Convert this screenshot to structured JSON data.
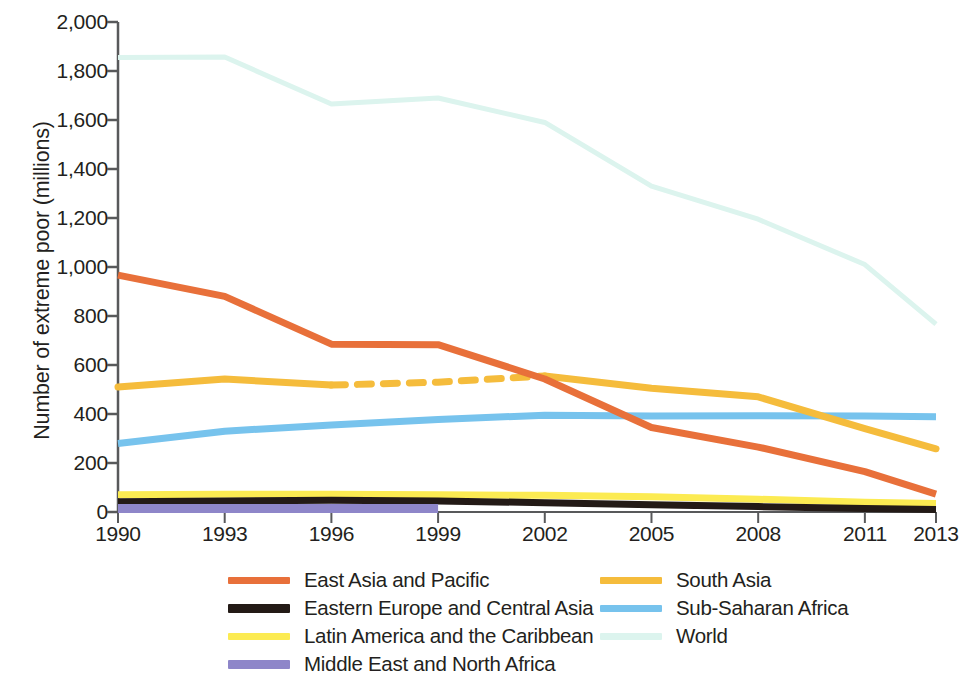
{
  "chart_data": {
    "type": "line",
    "title": "",
    "xlabel": "",
    "ylabel": "Number of extreme poor (millions)",
    "x": [
      1990,
      1993,
      1996,
      1999,
      2002,
      2005,
      2008,
      2011,
      2013
    ],
    "xtick_labels": [
      "1990",
      "1993",
      "1996",
      "1999",
      "2002",
      "2005",
      "2008",
      "2011",
      "2013"
    ],
    "ytick_labels": [
      "0",
      "200",
      "400",
      "600",
      "800",
      "1,000",
      "1,200",
      "1,400",
      "1,600",
      "1,800",
      "2,000"
    ],
    "ytick_values": [
      0,
      200,
      400,
      600,
      800,
      1000,
      1200,
      1400,
      1600,
      1800,
      2000
    ],
    "ylim": [
      0,
      2000
    ],
    "xlim": [
      1990,
      2013
    ],
    "grid": false,
    "legend_position": "bottom",
    "series": [
      {
        "name": "East Asia and Pacific",
        "color": "#E8703A",
        "width": 7,
        "dash_segment": null,
        "values": [
          967,
          880,
          685,
          683,
          543,
          345,
          265,
          165,
          73
        ]
      },
      {
        "name": "Eastern Europe and Central Asia",
        "color": "#231A16",
        "width": 7,
        "dash_segment": null,
        "values": [
          42,
          45,
          48,
          45,
          38,
          30,
          22,
          14,
          10
        ]
      },
      {
        "name": "Latin America and the Caribbean",
        "color": "#FCEB52",
        "width": 7,
        "dash_segment": null,
        "values": [
          70,
          72,
          72,
          70,
          68,
          62,
          52,
          40,
          35
        ]
      },
      {
        "name": "Middle East and North Africa",
        "color": "#8E86C9",
        "width": 9,
        "dash_segment": null,
        "values": [
          14,
          14,
          14,
          14,
          null,
          null,
          null,
          null,
          null
        ]
      },
      {
        "name": "South Asia",
        "color": "#F5BC3C",
        "width": 7,
        "dash_segment": [
          1996,
          2002
        ],
        "values": [
          510,
          543,
          518,
          530,
          555,
          505,
          470,
          340,
          258
        ]
      },
      {
        "name": "Sub-Saharan Africa",
        "color": "#77C3ED",
        "width": 7,
        "dash_segment": null,
        "values": [
          280,
          330,
          355,
          378,
          395,
          392,
          393,
          392,
          389
        ]
      },
      {
        "name": "World",
        "color": "#DCF4EE",
        "width": 5,
        "dash_segment": null,
        "values": [
          1855,
          1857,
          1665,
          1690,
          1590,
          1330,
          1195,
          1010,
          767
        ]
      }
    ],
    "legend": [
      {
        "label": "East Asia and Pacific",
        "color": "#E8703A",
        "thick": false
      },
      {
        "label": "South Asia",
        "color": "#F5BC3C",
        "thick": false
      },
      {
        "label": "Eastern Europe and Central Asia",
        "color": "#231A16",
        "thick": true
      },
      {
        "label": "Sub-Saharan Africa",
        "color": "#77C3ED",
        "thick": false
      },
      {
        "label": "Latin America and the Caribbean",
        "color": "#FCEB52",
        "thick": false
      },
      {
        "label": "World",
        "color": "#DCF4EE",
        "thick": false
      },
      {
        "label": "Middle East and North Africa",
        "color": "#8E86C9",
        "thick": true
      }
    ]
  },
  "axis": {
    "line_color": "#58595B"
  }
}
